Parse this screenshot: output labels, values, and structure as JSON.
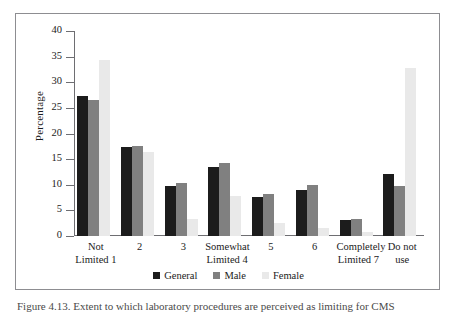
{
  "figure": {
    "caption": "Figure 4.13. Extent to which laboratory procedures are perceived as limiting for CMS"
  },
  "legend": {
    "position": "bottom-center",
    "items": [
      {
        "label": "General",
        "color": "#1c1c1c"
      },
      {
        "label": "Male",
        "color": "#808080"
      },
      {
        "label": "Female",
        "color": "#e9e9e9"
      }
    ]
  },
  "yaxis": {
    "title": "Percentage",
    "ticks": [
      "0",
      "5",
      "10",
      "15",
      "20",
      "25",
      "30",
      "35",
      "40"
    ]
  },
  "chart_data": {
    "type": "bar",
    "title": "",
    "xlabel": "",
    "ylabel": "Percentage",
    "ylim": [
      0,
      40
    ],
    "ytick_step": 5,
    "grid": false,
    "legend_position": "bottom-center",
    "categories": [
      "Not\nLimited 1",
      "2",
      "3",
      "Somewhat\nLimited 4",
      "5",
      "6",
      "Completely\nLimited 7",
      "Do not use"
    ],
    "series": [
      {
        "name": "General",
        "color": "#1c1c1c",
        "values": [
          27.4,
          17.4,
          9.8,
          13.4,
          7.6,
          9.0,
          3.1,
          12.1
        ]
      },
      {
        "name": "Male",
        "color": "#808080",
        "values": [
          26.6,
          17.6,
          10.4,
          14.2,
          8.2,
          9.9,
          3.3,
          9.7
        ]
      },
      {
        "name": "Female",
        "color": "#e9e9e9",
        "values": [
          34.4,
          16.4,
          3.4,
          7.8,
          2.6,
          1.5,
          0.8,
          32.8
        ]
      }
    ]
  }
}
